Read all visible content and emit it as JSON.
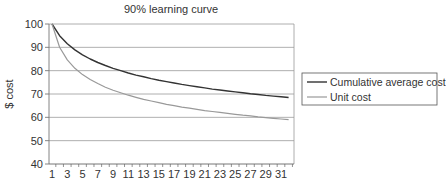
{
  "chart_data": {
    "type": "line",
    "title": "90% learning curve",
    "xlabel": "",
    "ylabel": "$ cost",
    "ylim": [
      40,
      100
    ],
    "yticks": [
      40,
      50,
      60,
      70,
      80,
      90,
      100
    ],
    "xlim": [
      1,
      32
    ],
    "xtick_labels": [
      "1",
      "3",
      "5",
      "7",
      "9",
      "11",
      "13",
      "15",
      "17",
      "19",
      "21",
      "23",
      "25",
      "27",
      "29",
      "31"
    ],
    "grid": "horizontal",
    "legend_position": "right",
    "x": [
      1,
      2,
      3,
      4,
      5,
      6,
      7,
      8,
      9,
      10,
      11,
      12,
      13,
      14,
      15,
      16,
      17,
      18,
      19,
      20,
      21,
      22,
      23,
      24,
      25,
      26,
      27,
      28,
      29,
      30,
      31,
      32
    ],
    "series": [
      {
        "name": "Cumulative average cost",
        "color": "#333333",
        "values": [
          100,
          95,
          91.5,
          88.9,
          86.8,
          85.0,
          83.5,
          82.2,
          81.0,
          80.0,
          79.0,
          78.1,
          77.4,
          76.6,
          75.9,
          75.3,
          74.7,
          74.1,
          73.6,
          73.1,
          72.6,
          72.1,
          71.7,
          71.3,
          70.9,
          70.5,
          70.1,
          69.8,
          69.4,
          69.1,
          68.8,
          68.5
        ]
      },
      {
        "name": "Unit cost",
        "color": "#999999",
        "values": [
          100,
          90,
          84.6,
          81,
          78.3,
          76.2,
          74.5,
          72.9,
          71.6,
          70.5,
          69.5,
          68.6,
          67.7,
          67.0,
          66.3,
          65.6,
          65.0,
          64.4,
          63.9,
          63.4,
          62.9,
          62.5,
          62.1,
          61.7,
          61.3,
          60.9,
          60.6,
          60.2,
          59.9,
          59.6,
          59.3,
          59.0
        ]
      }
    ]
  }
}
